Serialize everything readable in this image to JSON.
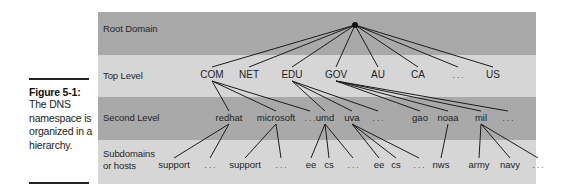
{
  "caption": {
    "title": "Figure 5-1:",
    "text": "The DNS namespace is organized in a hierarchy."
  },
  "levels": [
    {
      "label": "Root Domain"
    },
    {
      "label": "Top Level"
    },
    {
      "label": "Second Level"
    },
    {
      "label": "Subdomains or hosts"
    }
  ],
  "tree": {
    "root": "root",
    "top_level": [
      "COM",
      "NET",
      "EDU",
      "GOV",
      "AU",
      "CA",
      "...",
      "US"
    ],
    "second_level": [
      {
        "name": "redhat",
        "parent": "COM"
      },
      {
        "name": "microsoft",
        "parent": "COM"
      },
      {
        "name": "...",
        "parent": "COM"
      },
      {
        "name": "umd",
        "parent": "EDU"
      },
      {
        "name": "uva",
        "parent": "EDU"
      },
      {
        "name": "...",
        "parent": "EDU"
      },
      {
        "name": "gao",
        "parent": "GOV"
      },
      {
        "name": "noaa",
        "parent": "GOV"
      },
      {
        "name": "mil",
        "parent": "GOV"
      },
      {
        "name": "...",
        "parent": "GOV"
      }
    ],
    "hosts": [
      {
        "name": "support",
        "parent": "redhat"
      },
      {
        "name": "...",
        "parent": "redhat"
      },
      {
        "name": "support",
        "parent": "microsoft"
      },
      {
        "name": "...",
        "parent": "microsoft"
      },
      {
        "name": "ee",
        "parent": "umd"
      },
      {
        "name": "cs",
        "parent": "umd"
      },
      {
        "name": "...",
        "parent": "umd"
      },
      {
        "name": "ee",
        "parent": "uva"
      },
      {
        "name": "cs",
        "parent": "uva"
      },
      {
        "name": "...",
        "parent": "uva"
      },
      {
        "name": "nws",
        "parent": "noaa"
      },
      {
        "name": "army",
        "parent": "mil"
      },
      {
        "name": "navy",
        "parent": "mil"
      },
      {
        "name": "...",
        "parent": "mil"
      }
    ]
  }
}
